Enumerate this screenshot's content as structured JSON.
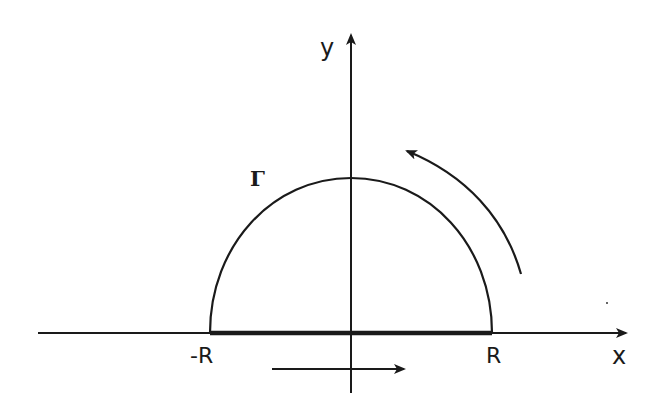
{
  "diagram": {
    "type": "contour-diagram",
    "axes": {
      "x_label": "x",
      "y_label": "y"
    },
    "labels": {
      "contour": "Γ",
      "left_endpoint": "-R",
      "right_endpoint": "R"
    },
    "colors": {
      "ink": "#1a1a1a",
      "background": "#ffffff"
    },
    "elements": [
      {
        "name": "x-axis",
        "kind": "arrow",
        "direction": "right"
      },
      {
        "name": "y-axis",
        "kind": "arrow",
        "direction": "up"
      },
      {
        "name": "semicircle-arc",
        "kind": "arc",
        "label": "Γ",
        "from": "R",
        "to": "-R"
      },
      {
        "name": "real-segment",
        "kind": "thick-line",
        "from": "-R",
        "to": "R"
      },
      {
        "name": "direction-arrow-bottom",
        "kind": "arrow",
        "direction": "right"
      },
      {
        "name": "direction-arrow-arc",
        "kind": "curved-arrow",
        "direction": "counterclockwise"
      }
    ]
  }
}
